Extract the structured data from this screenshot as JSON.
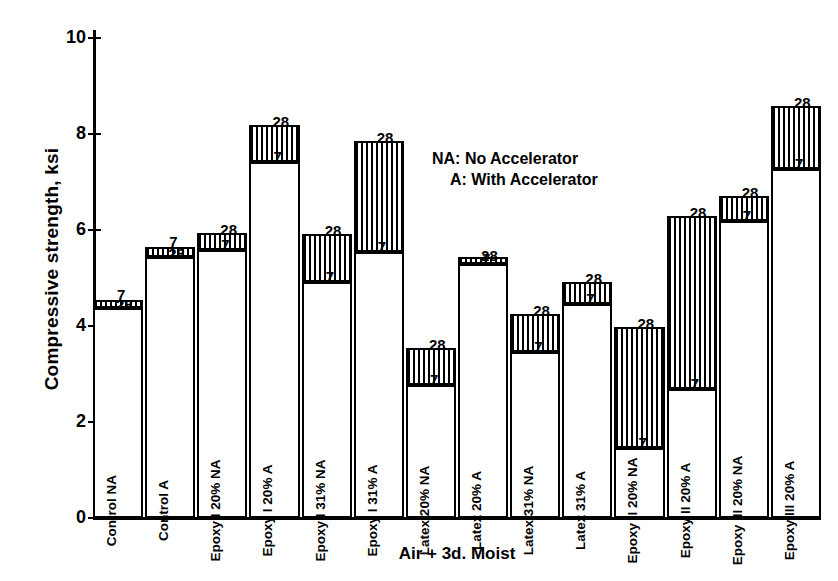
{
  "chart_data": {
    "type": "bar",
    "title": "",
    "xlabel": "Air + 3d. Moist",
    "ylabel": "Compressive strength, ksi",
    "ylim": [
      0,
      10
    ],
    "yticks": [
      0,
      2,
      4,
      6,
      8,
      10
    ],
    "grid": false,
    "legend_position": "upper-center-right",
    "legend": [
      "NA: No Accelerator",
      "A: With Accelerator"
    ],
    "series_labels": [
      "7",
      "28"
    ],
    "series_note": "Each column shows the 7-day strength as the open base bar and the 28-day strength as the hatched cap on top; the small numerals 7 and 28 mark the two levels.",
    "categories": [
      "Control NA",
      "Control A",
      "Epoxy I 20% NA",
      "Epoxy I 20% A",
      "Epoxy I 31% NA",
      "Epoxy I 31% A",
      "Latex 20% NA",
      "Latex 20% A",
      "Latex 31% NA",
      "Latex 31% A",
      "Epoxy II 20% NA",
      "Epoxy II 20% A",
      "Epoxy III 20% NA",
      "Epoxy III 20% A"
    ],
    "series": [
      {
        "name": "7",
        "values": [
          4.55,
          5.65,
          5.58,
          7.42,
          4.92,
          5.55,
          2.78,
          5.3,
          3.45,
          4.45,
          1.45,
          2.68,
          6.18,
          7.28
        ]
      },
      {
        "name": "28",
        "values": [
          4.38,
          5.45,
          5.95,
          8.2,
          5.92,
          7.85,
          3.55,
          5.4,
          4.25,
          4.92,
          3.98,
          6.3,
          6.72,
          8.58
        ]
      }
    ]
  },
  "axis": {
    "y_title": "Compressive strength, ksi",
    "x_title": "Air + 3d. Moist",
    "ytick_labels": [
      "10",
      "8",
      "6",
      "4",
      "2",
      "0"
    ]
  },
  "legend": {
    "line1": "NA: No Accelerator",
    "line2": "A: With Accelerator"
  },
  "bars": [
    {
      "label": "Control NA",
      "v7": 4.55,
      "v28": 4.38,
      "l7": "7",
      "l28": "28"
    },
    {
      "label": "Control A",
      "v7": 5.65,
      "v28": 5.45,
      "l7": "7",
      "l28": "28"
    },
    {
      "label": "Epoxy I 20% NA",
      "v7": 5.58,
      "v28": 5.95,
      "l7": "7",
      "l28": "28"
    },
    {
      "label": "Epoxy I 20% A",
      "v7": 7.42,
      "v28": 8.2,
      "l7": "7",
      "l28": "28"
    },
    {
      "label": "Epoxy I 31% NA",
      "v7": 4.92,
      "v28": 5.92,
      "l7": "7",
      "l28": "28"
    },
    {
      "label": "Epoxy I 31% A",
      "v7": 5.55,
      "v28": 7.85,
      "l7": "7",
      "l28": "28"
    },
    {
      "label": "Latex 20% NA",
      "v7": 2.78,
      "v28": 3.55,
      "l7": "7",
      "l28": "28"
    },
    {
      "label": "Latex 20% A",
      "v7": 5.3,
      "v28": 5.4,
      "l7": "7",
      "l28": "28"
    },
    {
      "label": "Latex 31% NA",
      "v7": 3.45,
      "v28": 4.25,
      "l7": "7",
      "l28": "28"
    },
    {
      "label": "Latex 31% A",
      "v7": 4.45,
      "v28": 4.92,
      "l7": "7",
      "l28": "28"
    },
    {
      "label": "Epoxy II 20% NA",
      "v7": 1.45,
      "v28": 3.98,
      "l7": "7",
      "l28": "28"
    },
    {
      "label": "Epoxy II 20% A",
      "v7": 2.68,
      "v28": 6.3,
      "l7": "7",
      "l28": "28"
    },
    {
      "label": "Epoxy III 20% NA",
      "v7": 6.18,
      "v28": 6.72,
      "l7": "7",
      "l28": "28"
    },
    {
      "label": "Epoxy III 20% A",
      "v7": 7.28,
      "v28": 8.58,
      "l7": "7",
      "l28": "28"
    }
  ]
}
